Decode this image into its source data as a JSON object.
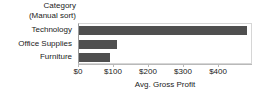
{
  "chart_data": {
    "type": "bar",
    "orientation": "horizontal",
    "title": "",
    "row_header": {
      "line1": "Category",
      "line2": "(Manual sort)"
    },
    "categories": [
      "Technology",
      "Office Supplies",
      "Furniture"
    ],
    "values": [
      480,
      108,
      88
    ],
    "series": [
      {
        "name": "Avg. Gross Profit",
        "values": [
          480,
          108,
          88
        ]
      }
    ],
    "xlabel": "Avg. Gross Profit",
    "ylabel": "Category",
    "xlim": [
      0,
      497
    ],
    "xticks": [
      0,
      100,
      200,
      300,
      400
    ],
    "xticklabels": [
      "$0",
      "$100",
      "$200",
      "$300",
      "$400"
    ],
    "grid": false,
    "legend": false,
    "bar_color": "#4f4f4f",
    "plot_border_color": "#d6d6d6",
    "axis_color": "#b9b9b9"
  }
}
